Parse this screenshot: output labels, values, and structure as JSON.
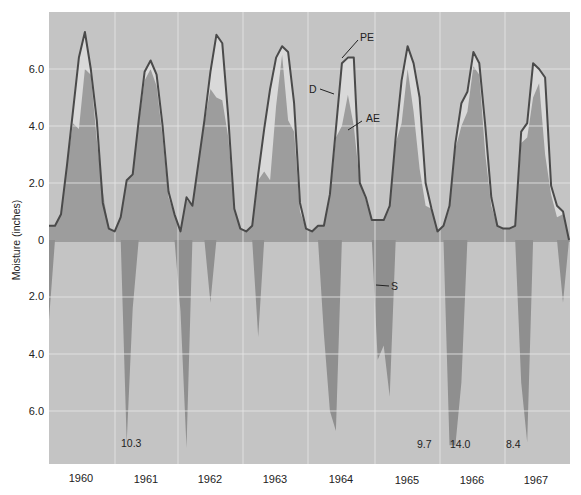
{
  "chart_data": {
    "type": "area",
    "title": "",
    "xlabel": "",
    "ylabel": "Moisture (inches)",
    "x_categories": [
      "1960",
      "1961",
      "1962",
      "1963",
      "1964",
      "1965",
      "1966",
      "1967"
    ],
    "upper_ticks": [
      "2.0",
      "4.0",
      "6.0"
    ],
    "lower_ticks": [
      "2.0",
      "4.0",
      "6.0"
    ],
    "zero_label": "0",
    "ylim_upper": [
      0,
      7.8
    ],
    "ylim_lower": [
      0,
      7.8
    ],
    "grid": true,
    "series": [
      {
        "name": "PE",
        "label": "PE",
        "description": "Potential evapotranspiration (line)",
        "values": [
          0.5,
          0.5,
          0.9,
          2.6,
          4.5,
          6.4,
          7.3,
          6.0,
          4.2,
          1.3,
          0.4,
          0.3,
          0.8,
          2.1,
          2.3,
          4.2,
          5.9,
          6.3,
          5.8,
          4.0,
          1.7,
          0.9,
          0.3,
          1.5,
          1.2,
          2.7,
          4.2,
          5.9,
          7.2,
          6.9,
          4.3,
          1.1,
          0.4,
          0.3,
          0.5,
          2.3,
          3.9,
          5.3,
          6.4,
          6.8,
          6.6,
          4.8,
          1.3,
          0.4,
          0.3,
          0.5,
          0.5,
          1.6,
          3.9,
          6.2,
          6.4,
          6.4,
          2.0,
          1.5,
          0.7,
          0.7,
          0.7,
          1.2,
          3.6,
          5.6,
          6.8,
          6.2,
          5.0,
          2.0,
          1.1,
          0.3,
          0.5,
          1.2,
          3.4,
          4.8,
          5.2,
          6.6,
          6.2,
          4.0,
          1.5,
          0.5,
          0.4,
          0.4,
          0.5,
          3.8,
          4.1,
          6.2,
          6.0,
          5.7,
          1.9,
          1.2,
          1.0,
          0.0
        ]
      },
      {
        "name": "AE",
        "label": "AE",
        "description": "Actual evapotranspiration (dark fill)",
        "values": [
          0.5,
          0.5,
          0.9,
          2.6,
          4.1,
          3.9,
          6.0,
          5.8,
          3.5,
          1.7,
          0.4,
          0.3,
          0.8,
          2.1,
          2.3,
          4.1,
          5.6,
          6.0,
          5.4,
          3.6,
          1.5,
          0.9,
          0.3,
          1.4,
          1.2,
          2.7,
          4.1,
          5.3,
          5.0,
          4.9,
          3.6,
          1.1,
          0.4,
          0.3,
          0.5,
          2.1,
          2.4,
          2.1,
          4.7,
          6.5,
          4.2,
          3.8,
          1.0,
          0.4,
          0.3,
          0.5,
          0.5,
          1.5,
          3.6,
          4.0,
          5.1,
          4.0,
          2.0,
          1.4,
          0.7,
          0.7,
          0.7,
          1.1,
          3.4,
          4.1,
          6.0,
          4.5,
          2.5,
          1.2,
          1.1,
          0.3,
          0.5,
          1.1,
          3.2,
          4.0,
          4.5,
          6.1,
          5.8,
          3.0,
          1.2,
          0.5,
          0.4,
          0.4,
          0.5,
          3.4,
          3.6,
          5.0,
          5.5,
          3.0,
          1.6,
          0.8,
          0.9,
          0.0
        ]
      },
      {
        "name": "D",
        "label": "D",
        "description": "Deficit (light region between PE and AE)"
      },
      {
        "name": "S",
        "label": "S",
        "description": "Surplus (below zero, drawn downward)",
        "values": [
          2.8,
          0,
          0,
          0,
          0,
          0,
          0,
          0,
          0,
          0,
          0,
          0,
          0,
          7.1,
          2.4,
          0,
          0,
          0,
          0,
          0,
          0,
          0,
          2.5,
          7.3,
          0,
          0,
          0,
          2.2,
          0,
          0,
          0,
          0,
          0,
          0,
          0,
          3.4,
          0,
          0,
          0,
          0,
          0,
          0,
          0,
          0,
          0,
          0,
          3.3,
          6.0,
          6.7,
          0,
          0,
          0,
          0,
          0,
          0,
          4.2,
          3.7,
          5.5,
          0,
          0,
          0,
          0,
          0,
          0,
          0,
          0,
          0,
          7.2,
          7.2,
          5.0,
          0,
          0,
          0,
          0,
          0,
          0,
          0,
          0,
          0,
          5.0,
          7.1,
          0,
          0,
          0,
          0,
          0,
          2.2,
          0.0
        ]
      }
    ],
    "annotations": [
      {
        "text": "10.3",
        "note": "S peak clipped, 1960-61 winter"
      },
      {
        "text": "9.7",
        "note": "S peak clipped, 1965-66 winter"
      },
      {
        "text": "14.0",
        "note": "S peak clipped, 1966 winter"
      },
      {
        "text": "8.4",
        "note": "S peak clipped, 1966-67 winter"
      },
      {
        "text": "PE"
      },
      {
        "text": "D"
      },
      {
        "text": "AE"
      },
      {
        "text": "S"
      }
    ],
    "colors": {
      "background": "#c4c4c4",
      "ae_fill": "#9d9d9d",
      "deficit_fill": "#d9d9d9",
      "pe_line": "#4a4a4a",
      "surplus_fill": "#8f8f8f",
      "grid": "#e6e6e6"
    }
  }
}
